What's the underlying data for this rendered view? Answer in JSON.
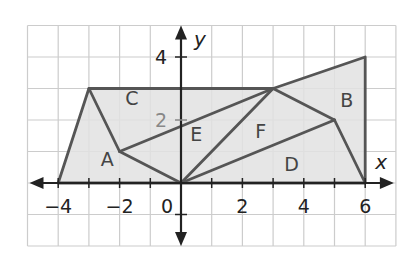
{
  "diagram": {
    "type": "coordinate-plane-composite-figure",
    "axes": {
      "x_label": "x",
      "y_label": "y",
      "x_tick_labels": [
        {
          "value": -4,
          "text": "−4"
        },
        {
          "value": -2,
          "text": "−2"
        },
        {
          "value": 0,
          "text": "0"
        },
        {
          "value": 2,
          "text": "2"
        },
        {
          "value": 4,
          "text": "4"
        },
        {
          "value": 6,
          "text": "6"
        }
      ],
      "y_tick_labels": [
        {
          "value": 4,
          "text": "4"
        },
        {
          "value": 2,
          "text": "2"
        }
      ],
      "grid_range": {
        "x": [
          -5,
          7
        ],
        "y": [
          -2,
          5
        ]
      }
    },
    "outer_polygon": [
      [
        -4,
        0
      ],
      [
        -3,
        3
      ],
      [
        3,
        3
      ],
      [
        6,
        4
      ],
      [
        6,
        0
      ]
    ],
    "points": {
      "A": [
        -2,
        1
      ],
      "O": [
        0,
        0
      ],
      "P": [
        3,
        3
      ],
      "B": [
        5,
        2
      ],
      "Q": [
        -3,
        3
      ],
      "R": [
        6,
        4
      ],
      "S": [
        6,
        0
      ],
      "T": [
        -4,
        0
      ]
    },
    "segments": [
      [
        [
          -3,
          3
        ],
        [
          -2,
          1
        ]
      ],
      [
        [
          -2,
          1
        ],
        [
          0,
          0
        ]
      ],
      [
        [
          -2,
          1
        ],
        [
          3,
          3
        ]
      ],
      [
        [
          0,
          0
        ],
        [
          3,
          3
        ]
      ],
      [
        [
          0,
          0
        ],
        [
          5,
          2
        ]
      ],
      [
        [
          3,
          3
        ],
        [
          5,
          2
        ]
      ],
      [
        [
          5,
          2
        ],
        [
          6,
          0
        ]
      ]
    ],
    "region_labels": [
      {
        "text": "A",
        "at": [
          -2.4,
          0.75
        ]
      },
      {
        "text": "B",
        "at": [
          5.4,
          2.65
        ]
      },
      {
        "text": "C",
        "at": [
          -1.6,
          2.7
        ]
      },
      {
        "text": "D",
        "at": [
          3.6,
          0.6
        ]
      },
      {
        "text": "E",
        "at": [
          0.5,
          1.55
        ]
      },
      {
        "text": "F",
        "at": [
          2.6,
          1.65
        ]
      }
    ],
    "colors": {
      "fill": "#e2e2e2",
      "stroke": "#555555",
      "grid": "#cccccc",
      "axis": "#222222",
      "region_label": "#444444",
      "faded_tick": "#888888"
    }
  }
}
